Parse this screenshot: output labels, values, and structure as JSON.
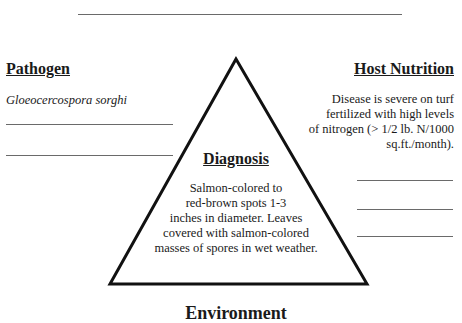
{
  "pathogen": {
    "heading": "Pathogen",
    "name": "Gloeocercospora sorghi"
  },
  "host_nutrition": {
    "heading": "Host Nutrition",
    "lines": [
      "Disease is severe on turf",
      "fertilized with high levels",
      "of nitrogen (> 1/2 lb. N/1000",
      "sq.ft./month)."
    ]
  },
  "diagnosis": {
    "heading": "Diagnosis",
    "lines": [
      "Salmon-colored to",
      "red-brown spots 1-3",
      "inches in diameter.  Leaves",
      "covered with salmon-colored",
      "masses of spores in wet weather."
    ]
  },
  "environment": {
    "heading": "Environment"
  },
  "colors": {
    "line": "#6a6a6a",
    "triangle": "#111111",
    "text": "#1a1a1a"
  }
}
